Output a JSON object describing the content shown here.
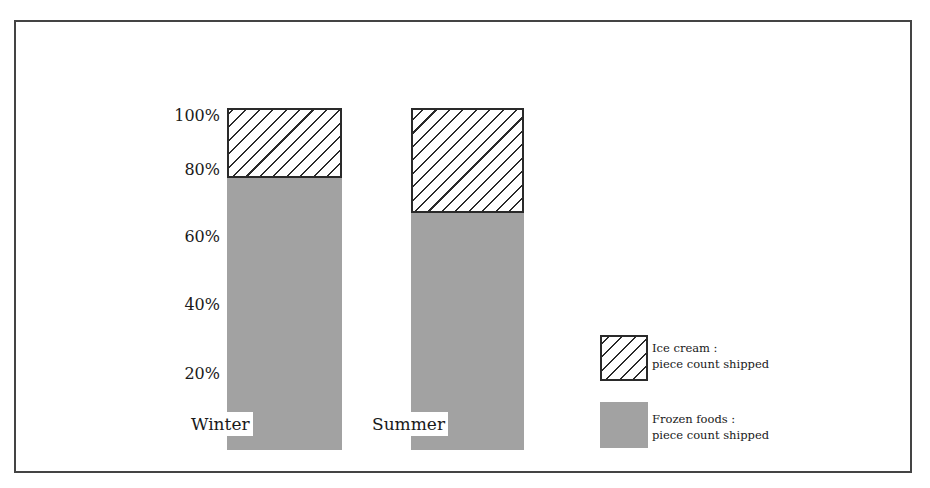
{
  "chart_data": {
    "type": "bar",
    "stacked": true,
    "normalized_percent": true,
    "title": "",
    "xlabel": "",
    "ylabel": "",
    "ylim": [
      0,
      100
    ],
    "y_ticks": [
      "20%",
      "40%",
      "60%",
      "80%",
      "100%"
    ],
    "grid": false,
    "categories": [
      "Winter",
      "Summer"
    ],
    "series": [
      {
        "name": "Frozen foods: piece count shipped",
        "values": [
          80,
          70
        ],
        "fill": "#a2a2a2",
        "pattern": "solid"
      },
      {
        "name": "Ice cream: piece count shipped",
        "values": [
          20,
          30
        ],
        "fill": "#ffffff",
        "pattern": "diagonal-hatch"
      }
    ],
    "legend_position": "right-bottom"
  },
  "axis": {
    "ticks": [
      {
        "label": "100%",
        "y": 107
      },
      {
        "label": "80%",
        "y": 161
      },
      {
        "label": "60%",
        "y": 228
      },
      {
        "label": "40%",
        "y": 296
      },
      {
        "label": "20%",
        "y": 365
      }
    ]
  },
  "bars": [
    {
      "category": "Winter",
      "left": 227,
      "width": 115,
      "top": 108,
      "bottom": 450,
      "ice_pct": 20,
      "frozen_pct": 80
    },
    {
      "category": "Summer",
      "left": 411,
      "width": 113,
      "top": 108,
      "bottom": 450,
      "ice_pct": 30,
      "frozen_pct": 70
    }
  ],
  "legend": {
    "ice_cream": {
      "line1": "Ice cream :",
      "line2": "piece count shipped"
    },
    "frozen_foods": {
      "line1": "Frozen foods :",
      "line2": "piece count shipped"
    }
  }
}
